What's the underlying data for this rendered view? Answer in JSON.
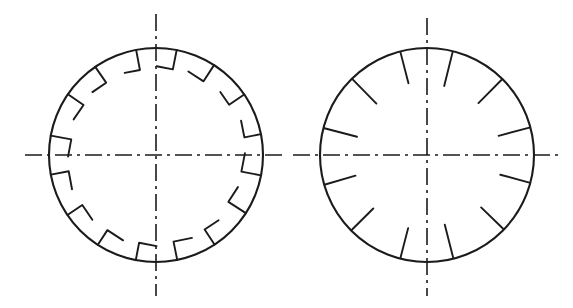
{
  "figure": {
    "domain": "Diagram",
    "kind": "engineering-line-drawing",
    "canvas": {
      "width": 573,
      "height": 308,
      "background": "#ffffff"
    },
    "ink_color": "#1b1b1b",
    "title": "",
    "caption": ""
  },
  "views": [
    {
      "id": "left-view",
      "name": "left-circle",
      "label": "",
      "center": {
        "x": 156,
        "y": 155
      },
      "radius": 107,
      "rim_stroke_width": 2.1,
      "feature": {
        "type": "hook-notch",
        "count": 16,
        "angle_step_deg": 22.5,
        "start_angle_deg": 11.25,
        "radial_depth": 19,
        "tangential_length": 17,
        "hand_direction": "clockwise"
      },
      "centerlines": {
        "style": "dash-dot",
        "horizontal": {
          "x1": 25,
          "x2": 287,
          "y": 155
        },
        "vertical": {
          "y1": 14,
          "y2": 296,
          "x": 156
        },
        "dash_pattern": "17 5 3 5"
      }
    },
    {
      "id": "right-view",
      "name": "right-circle",
      "label": "",
      "center": {
        "x": 427,
        "y": 155
      },
      "radius": 107,
      "rim_stroke_width": 2.1,
      "feature": {
        "type": "radial-tick",
        "count": 12,
        "angle_step_deg": 30,
        "start_angle_deg": 15,
        "radial_depth": 33,
        "hand_direction": "clockwise"
      },
      "centerlines": {
        "style": "dash-dot",
        "horizontal": {
          "x1": 293,
          "x2": 560,
          "y": 155
        },
        "vertical": {
          "y1": 18,
          "y2": 296,
          "x": 427
        },
        "dash_pattern": "17 5 3 5"
      }
    }
  ],
  "chart_data": {
    "type": "scatter",
    "xlabel": "",
    "ylabel": "",
    "series": [
      {
        "name": "left-disc-hook-notches",
        "note": "16 L-shaped notches, 22.5 deg apart, first at 11.25 deg",
        "angles_deg": [
          11.25,
          33.75,
          56.25,
          78.75,
          101.25,
          123.75,
          146.25,
          168.75,
          191.25,
          213.75,
          236.25,
          258.75,
          281.25,
          303.75,
          326.25,
          348.75
        ],
        "values": [
          1,
          1,
          1,
          1,
          1,
          1,
          1,
          1,
          1,
          1,
          1,
          1,
          1,
          1,
          1,
          1
        ]
      },
      {
        "name": "right-disc-radial-ticks",
        "note": "12 straight radial ticks, 30 deg apart, first at 15 deg",
        "angles_deg": [
          15,
          45,
          75,
          105,
          135,
          165,
          195,
          225,
          255,
          285,
          315,
          345
        ],
        "values": [
          1,
          1,
          1,
          1,
          1,
          1,
          1,
          1,
          1,
          1,
          1,
          1
        ]
      }
    ]
  }
}
